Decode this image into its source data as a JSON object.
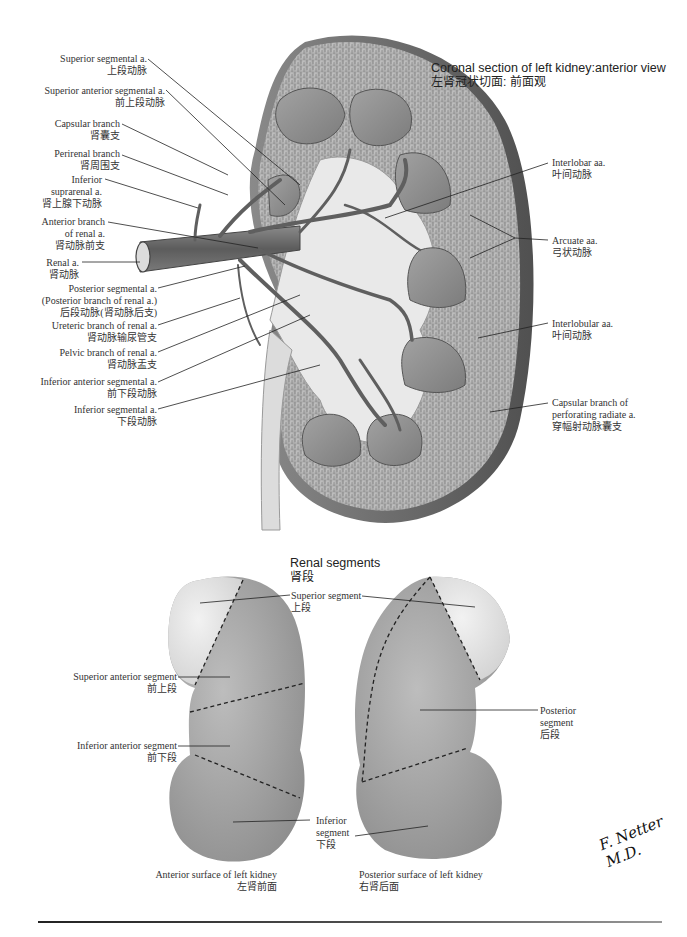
{
  "figure": {
    "top_title": {
      "en": "Coronal section of left kidney:anterior view",
      "zh": "左肾冠状切面: 前面观"
    },
    "left_labels": [
      {
        "id": "superior-segmental-a",
        "en": "Superior segmental a.",
        "zh": "上段动脉"
      },
      {
        "id": "superior-anterior-segmental-a",
        "en": "Superior anterior segmental a.",
        "zh": "前上段动脉"
      },
      {
        "id": "capsular-branch",
        "en": "Capsular branch",
        "zh": "肾囊支"
      },
      {
        "id": "perirenal-branch",
        "en": "Perirenal branch",
        "zh": "肾周围支"
      },
      {
        "id": "inferior-suprarenal-a",
        "en": "Inferior",
        "en2": "suprarenal a.",
        "zh": "肾上腺下动脉"
      },
      {
        "id": "anterior-branch-renal-a",
        "en": "Anterior branch",
        "en2": "of renal a.",
        "zh": "肾动脉前支"
      },
      {
        "id": "renal-a",
        "en": "Renal a.",
        "zh": "肾动脉"
      },
      {
        "id": "posterior-segmental-a",
        "en": "Posterior segmental a.",
        "en2": "(Posterior branch of renal a.)",
        "zh": "后段动脉(肾动脉后支)"
      },
      {
        "id": "ureteric-branch",
        "en": "Ureteric branch of renal a.",
        "zh": "肾动脉输尿管支"
      },
      {
        "id": "pelvic-branch",
        "en": "Pelvic branch of renal a.",
        "zh": "肾动脉盂支"
      },
      {
        "id": "inferior-anterior-segmental-a",
        "en": "Inferior anterior segmental a.",
        "zh": "前下段动脉"
      },
      {
        "id": "inferior-segmental-a",
        "en": "Inferior segmental a.",
        "zh": "下段动脉"
      }
    ],
    "right_labels": [
      {
        "id": "interlobar-aa",
        "en": "Interlobar aa.",
        "zh": "叶间动脉"
      },
      {
        "id": "arcuate-aa",
        "en": "Arcuate aa.",
        "zh": "弓状动脉"
      },
      {
        "id": "interlobular-aa",
        "en": "Interlobular aa.",
        "zh": "叶间动脉"
      },
      {
        "id": "capsular-branch-perforating",
        "en": "Capsular branch of",
        "en2": "perforating radiate a.",
        "zh": "穿幅射动脉囊支"
      }
    ]
  },
  "segments": {
    "title": {
      "en": "Renal segments",
      "zh": "肾段"
    },
    "labels": [
      {
        "id": "superior-segment",
        "en": "Superior segment",
        "zh": "上段"
      },
      {
        "id": "superior-anterior-segment",
        "en": "Superior anterior segment",
        "zh": "前上段"
      },
      {
        "id": "inferior-anterior-segment",
        "en": "Inferior anterior segment",
        "zh": "前下段"
      },
      {
        "id": "inferior-segment",
        "en": "Inferior",
        "en2": "segment",
        "zh": "下段"
      },
      {
        "id": "posterior-segment",
        "en": "Posterior",
        "en2": "segment",
        "zh": "后段"
      }
    ],
    "captions": [
      {
        "en": "Anterior surface of left kidney",
        "zh": "左肾前面"
      },
      {
        "en": "Posterior surface of left kidney",
        "zh": "右肾后面"
      }
    ]
  },
  "signature": "F. Netter M.D.",
  "colors": {
    "cortex": "#b9b9b9",
    "capsule": "#6e6e6e",
    "pyramid": "#8e8e8e",
    "pelvis": "#e6e6e6",
    "artery": "#6a6a6a",
    "segment_light": "#e8e8e8",
    "segment_mid": "#a4a4a4",
    "segment_dark": "#909090"
  }
}
